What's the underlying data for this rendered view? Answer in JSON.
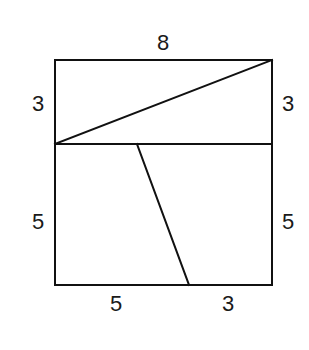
{
  "diagram": {
    "type": "geometry-dissection",
    "colors": {
      "line": "#111111",
      "text": "#1a1a1a",
      "background": "#ffffff"
    },
    "labels": {
      "top": "8",
      "upper_left": "3",
      "upper_right": "3",
      "lower_left": "5",
      "lower_right": "5",
      "bottom_left": "5",
      "bottom_right": "3"
    },
    "shapes": {
      "outer_square": "8x8 square",
      "upper_rectangle": "8x3 rectangle divided by diagonal",
      "lower_rectangle": "8x5 rectangle divided by slanted segment",
      "slanted_segment": "from top edge of lower rectangle (offset 3 from left) to bottom edge (offset 5 from left)"
    }
  }
}
